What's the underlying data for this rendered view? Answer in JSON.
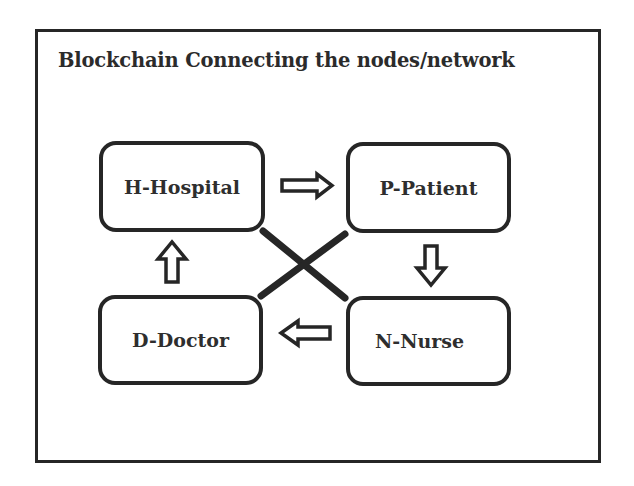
{
  "diagram": {
    "title": "Blockchain Connecting the nodes/network",
    "nodes": [
      {
        "id": "H",
        "label": "H-Hospital"
      },
      {
        "id": "P",
        "label": "P-Patient"
      },
      {
        "id": "N",
        "label": "N-Nurse"
      },
      {
        "id": "D",
        "label": "D-Doctor"
      }
    ],
    "edges": [
      {
        "from": "H",
        "to": "P",
        "type": "block-arrow",
        "direction": "right"
      },
      {
        "from": "P",
        "to": "N",
        "type": "block-arrow",
        "direction": "down"
      },
      {
        "from": "N",
        "to": "D",
        "type": "block-arrow",
        "direction": "left"
      },
      {
        "from": "D",
        "to": "H",
        "type": "block-arrow",
        "direction": "up"
      },
      {
        "from": "H",
        "to": "N",
        "type": "line",
        "style": "thick-diagonal"
      },
      {
        "from": "P",
        "to": "D",
        "type": "line",
        "style": "thick-diagonal"
      }
    ],
    "colors": {
      "stroke": "#262626",
      "text": "#2e2e2e",
      "background": "#ffffff"
    }
  }
}
